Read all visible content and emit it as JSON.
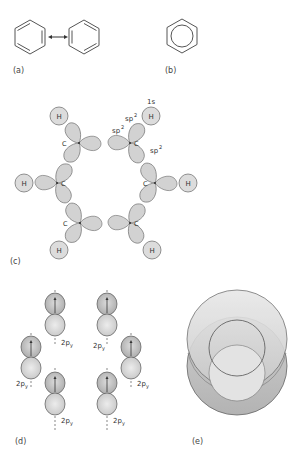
{
  "figure": {
    "panels": {
      "a": {
        "label": "(a)",
        "description": "Kekulé resonance structures",
        "arrow": "resonance-double-arrow"
      },
      "b": {
        "label": "(b)",
        "description": "Hexagon with inscribed circle"
      },
      "c": {
        "label": "(c)",
        "atoms": {
          "carbon": "C",
          "hydrogen": "H"
        },
        "orbital_labels": {
          "s": "1s",
          "sp2_a": "sp",
          "sp2_b": "sp",
          "sp2_c": "sp",
          "sup": "2"
        }
      },
      "d": {
        "label": "(d)",
        "orbital_label": "2p",
        "orbital_sub": "y"
      },
      "e": {
        "label": "(e)",
        "description": "Delocalized pi electron cloud"
      }
    }
  },
  "colors": {
    "line": "#555555",
    "lobe_fill": "#d4d4d4",
    "h_fill": "#dcdcdc",
    "p_top": "#bdbdbd",
    "p_bottom": "#dedede",
    "cloud_outer": "#c8c8c8",
    "cloud_inner": "#e6e6e6"
  }
}
